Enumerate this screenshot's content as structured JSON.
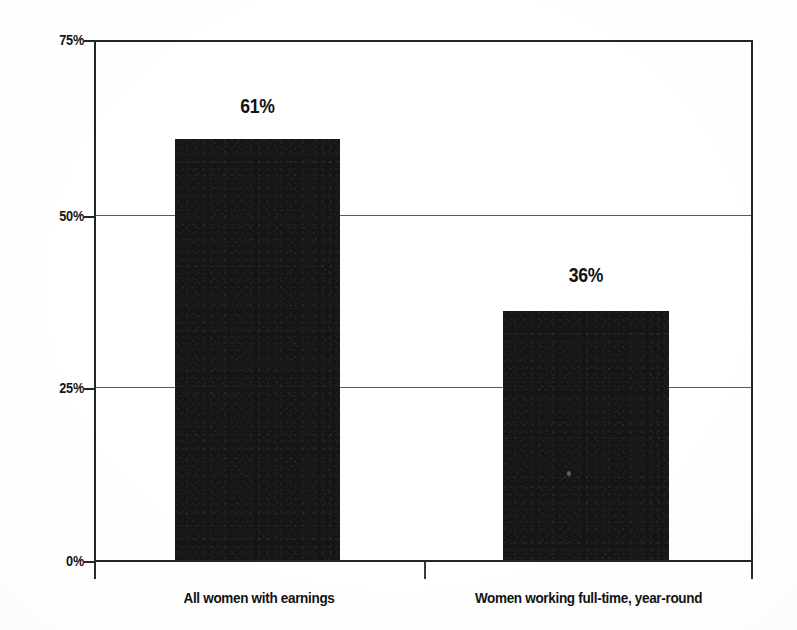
{
  "chart_data": {
    "type": "bar",
    "title": "",
    "subtitle": "",
    "xlabel": "",
    "ylabel": "",
    "categories": [
      "All women with earnings",
      "Women working full-time, year-round"
    ],
    "values": [
      61,
      36
    ],
    "value_labels": [
      "61%",
      "36%"
    ],
    "ylim": [
      0,
      75
    ],
    "yticks": [
      0,
      25,
      50,
      75
    ],
    "ytick_labels": [
      "0%",
      "25%",
      "50%",
      "75%"
    ],
    "grid": true,
    "gridlines_at": [
      25,
      50
    ],
    "legend": null,
    "legend_position": "none",
    "bar_color": "#161616",
    "axis_color": "#252525",
    "grid_color": "#5a5a5a",
    "background_color": "#ffffff",
    "annotations": []
  },
  "axis": {
    "ytick_0": "0%",
    "ytick_25": "25%",
    "ytick_50": "50%",
    "ytick_75": "75%"
  },
  "bars": [
    {
      "label": "All women with earnings",
      "value_label": "61%"
    },
    {
      "label": "Women working full-time, year-round",
      "value_label": "36%"
    }
  ]
}
